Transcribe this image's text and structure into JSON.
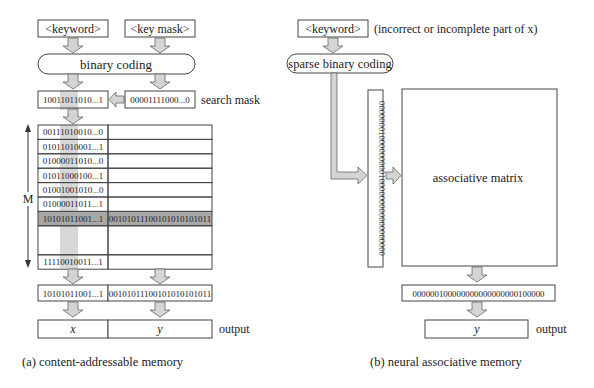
{
  "panel_a": {
    "keyword": "<keyword>",
    "key_mask": "<key mask>",
    "coding": "binary coding",
    "search_key": "10011011010...1",
    "mask_value": "00001111000...0",
    "mask_label": "search mask",
    "m_label": "M",
    "rows": [
      {
        "key": "00111010010...0",
        "value": ""
      },
      {
        "key": "01011010001...1",
        "value": ""
      },
      {
        "key": "01000011010...0",
        "value": ""
      },
      {
        "key": "01011000100...1",
        "value": ""
      },
      {
        "key": "01001001010...0",
        "value": ""
      },
      {
        "key": "01000011011...1",
        "value": ""
      },
      {
        "key": "10101011001...1",
        "value": "00101011100101010101011",
        "highlighted": true
      },
      {
        "key": "",
        "value": ""
      },
      {
        "key": "11110010011...1",
        "value": ""
      }
    ],
    "result_key": "10101011001...1",
    "result_value": "00101011100101010101011",
    "output_x": "x",
    "output_y": "y",
    "output_label": "output",
    "caption": "(a)  content-addressable memory"
  },
  "panel_b": {
    "keyword": "<keyword>",
    "keyword_note": "(incorrect or incomplete part of  x)",
    "coding": "sparse binary coding",
    "sparse_vector": "000000010000000001000000000000000000",
    "matrix_label": "associative matrix",
    "output_vector": "000000100000000000000000100000",
    "output_y": "y",
    "output_label": "output",
    "caption": "(b)  neural associative memory"
  },
  "colors": {
    "highlight_row": "#a8a8a8",
    "mask_column": "#d8d8d8",
    "arrow_fill": "#d4d4d4"
  }
}
